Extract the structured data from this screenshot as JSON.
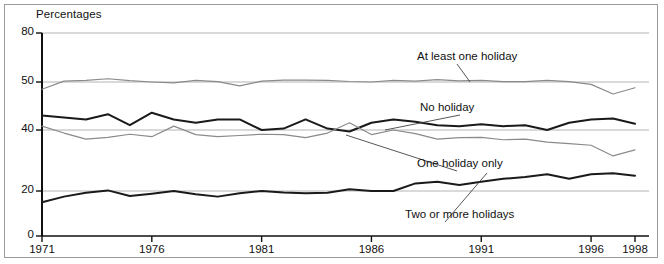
{
  "figure": {
    "axis_title": "Percentages",
    "background": "#ffffff",
    "border_color": "#9a9a9a"
  },
  "chart_data": {
    "type": "line",
    "title": "",
    "subtitle": "",
    "xlabel": "",
    "ylabel": "Percentages",
    "grid": true,
    "grid_lines": [
      20,
      40,
      50,
      80
    ],
    "legend_position": "inline-annotations",
    "xlim": [
      1971,
      1998
    ],
    "ylim": [
      0,
      80
    ],
    "y_axis_note": "broken / non-linear spacing between ticks",
    "yticks": [
      0,
      20,
      40,
      50,
      80
    ],
    "ytick_labels": [
      "0",
      "20",
      "40",
      "50",
      "80"
    ],
    "xticks": [
      1971,
      1976,
      1981,
      1986,
      1991,
      1996,
      1998
    ],
    "xtick_labels": [
      "1971",
      "1976",
      "1981",
      "1986",
      "1991",
      "1996",
      "1998"
    ],
    "x": [
      1971,
      1972,
      1973,
      1974,
      1975,
      1976,
      1977,
      1978,
      1979,
      1980,
      1981,
      1982,
      1983,
      1984,
      1985,
      1986,
      1987,
      1988,
      1989,
      1990,
      1991,
      1992,
      1993,
      1994,
      1995,
      1996,
      1997,
      1998
    ],
    "series": [
      {
        "name": "At least one holiday",
        "color": "#8a8a8a",
        "width": 1.2,
        "values": [
          48.5,
          50.5,
          51.0,
          52.0,
          50.8,
          50.0,
          49.8,
          51.0,
          50.2,
          49.2,
          50.5,
          51.2,
          51.2,
          51.0,
          50.3,
          50.0,
          51.0,
          50.5,
          51.5,
          50.7,
          51.0,
          50.2,
          50.2,
          51.0,
          50.2,
          49.5,
          47.5,
          48.8
        ]
      },
      {
        "name": "No holiday",
        "color": "#1a1a1a",
        "width": 2.0,
        "values": [
          43.0,
          42.6,
          42.2,
          43.3,
          41.0,
          43.6,
          42.2,
          41.5,
          42.2,
          42.2,
          40.0,
          40.3,
          42.2,
          40.3,
          39.5,
          41.5,
          42.2,
          41.7,
          41.0,
          40.8,
          41.2,
          40.8,
          41.0,
          40.0,
          41.5,
          42.2,
          42.4,
          41.3
        ]
      },
      {
        "name": "One holiday only",
        "color": "#8a8a8a",
        "width": 1.2,
        "values": [
          40.8,
          39.0,
          37.0,
          37.6,
          38.6,
          37.8,
          40.8,
          38.5,
          37.8,
          38.2,
          38.6,
          38.5,
          37.5,
          39.0,
          41.5,
          38.5,
          40.0,
          38.8,
          37.0,
          37.5,
          37.6,
          36.8,
          37.0,
          36.0,
          35.5,
          35.0,
          31.5,
          33.5
        ]
      },
      {
        "name": "Two or more holidays",
        "color": "#1a1a1a",
        "width": 2.0,
        "values": [
          15.0,
          17.5,
          19.2,
          20.2,
          17.8,
          18.8,
          20.0,
          18.6,
          17.5,
          19.0,
          20.0,
          19.3,
          19.0,
          19.2,
          20.6,
          20.0,
          20.0,
          22.5,
          23.0,
          22.0,
          23.0,
          24.0,
          24.6,
          25.5,
          24.0,
          25.5,
          25.8,
          25.0
        ]
      }
    ],
    "annotations": [
      {
        "text": "At least one holiday",
        "x": 417,
        "y": 50,
        "leader_to": [
          470,
          82
        ]
      },
      {
        "text": "No holiday",
        "x": 420,
        "y": 101,
        "leader_to": [
          385,
          130
        ]
      },
      {
        "text": "One holiday only",
        "x": 417,
        "y": 157,
        "leader_to": [
          346,
          135
        ]
      },
      {
        "text": "Two or more holidays",
        "x": 405,
        "y": 208,
        "leader_to": [
          487,
          173
        ]
      }
    ]
  }
}
